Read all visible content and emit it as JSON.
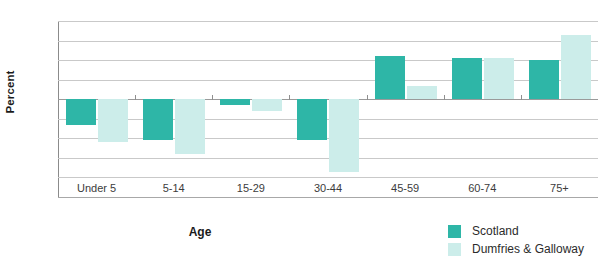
{
  "chart_data": {
    "type": "bar",
    "title": "",
    "subtitle": "",
    "xlabel": "Age",
    "ylabel": "Percent",
    "categories": [
      "Under 5",
      "5-14",
      "15-29",
      "30-44",
      "45-59",
      "60-74",
      "75+"
    ],
    "series": [
      {
        "name": "Scotland",
        "color": "#2EB6A7",
        "values": [
          -13,
          -21,
          -3,
          -21,
          22,
          21,
          20
        ]
      },
      {
        "name": "Dumfries & Galloway",
        "color": "#CCEDEA",
        "values": [
          -22,
          -28,
          -6,
          -37,
          7,
          21,
          33
        ]
      }
    ],
    "ylim": [
      -50,
      40
    ],
    "yticks": [
      40,
      30,
      20,
      10,
      0,
      -10,
      -20,
      -30,
      -40,
      -50
    ],
    "ytick_labels": [
      "40",
      "30",
      "20",
      "10",
      "0",
      "-10",
      "-20",
      "-30",
      "-40",
      "-50"
    ],
    "grid": true,
    "legend_position": "bottom-right"
  },
  "legend": {
    "items": [
      {
        "label": "Scotland",
        "color": "#2EB6A7"
      },
      {
        "label": "Dumfries & Galloway",
        "color": "#CCEDEA"
      }
    ]
  },
  "axes": {
    "y_title": "Percent",
    "x_title": "Age"
  }
}
